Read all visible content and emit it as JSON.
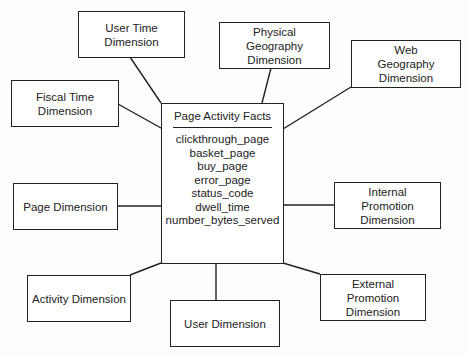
{
  "fact_table": {
    "title": "Page Activity Facts",
    "attributes": [
      "clickthrough_page",
      "basket_page",
      "buy_page",
      "error_page",
      "status_code",
      "dwell_time",
      "number_bytes_served"
    ]
  },
  "dimensions": {
    "user_time": "User Time Dimension",
    "physical_geography": "Physical Geography Dimension",
    "web_geography": "Web Geography Dimension",
    "fiscal_time": "Fiscal Time Dimension",
    "page": "Page Dimension",
    "internal_promotion": "Internal Promotion Dimension",
    "activity": "Activity Dimension",
    "user": "User Dimension",
    "external_promotion": "External Promotion Dimension"
  }
}
